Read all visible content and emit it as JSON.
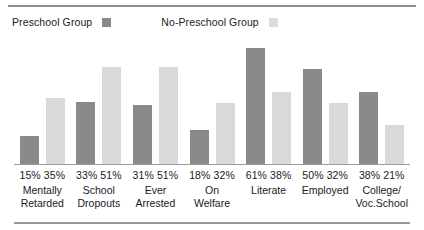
{
  "chart_data": {
    "type": "bar",
    "title": "",
    "subtitle": "",
    "xlabel": "",
    "ylabel": "",
    "ylim": [
      0,
      65
    ],
    "grid": false,
    "legend_position": "top-left",
    "categories": [
      "Mentally Retarded",
      "School Dropouts",
      "Ever Arrested",
      "On Welfare",
      "Literate",
      "Employed",
      "College/ Voc.School"
    ],
    "series": [
      {
        "name": "Preschool Group",
        "color": "#8a8a8a",
        "values": [
          15,
          33,
          31,
          18,
          61,
          50,
          38
        ]
      },
      {
        "name": "No-Preschool Group",
        "color": "#d9d9d9",
        "values": [
          35,
          51,
          51,
          32,
          38,
          32,
          21
        ]
      }
    ],
    "value_labels": [
      "15% 35%",
      "33% 51%",
      "31% 51%",
      "18% 32%",
      "61% 38%",
      "50% 32%",
      "38% 21%"
    ]
  },
  "legend": {
    "entries": [
      {
        "label": "Preschool Group",
        "swatch": "dark-gray-swatch"
      },
      {
        "label": "No-Preschool Group",
        "swatch": "light-gray-swatch"
      }
    ]
  },
  "axis": {
    "groups": [
      {
        "percents": "15% 35%",
        "line1": "Mentally",
        "line2": "Retarded"
      },
      {
        "percents": "33% 51%",
        "line1": "School",
        "line2": "Dropouts"
      },
      {
        "percents": "31% 51%",
        "line1": "Ever",
        "line2": "Arrested"
      },
      {
        "percents": "18% 32%",
        "line1": "On",
        "line2": "Welfare"
      },
      {
        "percents": "61% 38%",
        "line1": "Literate",
        "line2": ""
      },
      {
        "percents": "50% 32%",
        "line1": "Employed",
        "line2": ""
      },
      {
        "percents": "38% 21%",
        "line1": "College/",
        "line2": "Voc.School"
      }
    ]
  },
  "colors": {
    "bar_dark": "#8a8a8a",
    "bar_light": "#d9d9d9",
    "rule": "#8e8e8e",
    "text": "#1a1a1a",
    "background": "#ffffff"
  }
}
